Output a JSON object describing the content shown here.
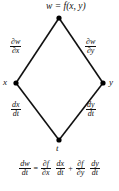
{
  "diagram": {
    "type": "chain-rule-tree",
    "title_node": "w = f(x,  y)",
    "nodes": [
      {
        "id": "w",
        "label": "w = f(x,  y)",
        "x": 59,
        "y": 18
      },
      {
        "id": "x",
        "label": "x",
        "x": 16,
        "y": 83
      },
      {
        "id": "y",
        "label": "y",
        "x": 103,
        "y": 83
      },
      {
        "id": "t",
        "label": "t",
        "x": 59,
        "y": 140
      }
    ],
    "node_labels": {
      "top": "w = f(x,  y)",
      "left": "x",
      "right": "y",
      "bottom": "t"
    },
    "edges": [
      {
        "id": "w-x",
        "from": "w",
        "to": "x",
        "label_numerator": "∂w",
        "label_denominator": "∂x"
      },
      {
        "id": "w-y",
        "from": "w",
        "to": "y",
        "label_numerator": "∂w",
        "label_denominator": "∂y"
      },
      {
        "id": "x-t",
        "from": "x",
        "to": "t",
        "label_numerator": "dx",
        "label_denominator": "dt"
      },
      {
        "id": "y-t",
        "from": "y",
        "to": "t",
        "label_numerator": "dy",
        "label_denominator": "dt"
      }
    ],
    "line_color": "#111111",
    "node_color": "#000000",
    "background": "#ffffff"
  },
  "formula": {
    "lhs": {
      "num": "dw",
      "den": "dt"
    },
    "equals": "=",
    "term1": [
      {
        "num": "∂f",
        "den": "∂x"
      },
      {
        "num": "dx",
        "den": "dt"
      }
    ],
    "plus": "+",
    "term2": [
      {
        "num": "∂f",
        "den": "∂y"
      },
      {
        "num": "dy",
        "den": "dt"
      }
    ],
    "text": "dw/dt = ∂f/∂x dx/dt + ∂f/∂y dy/dt"
  }
}
